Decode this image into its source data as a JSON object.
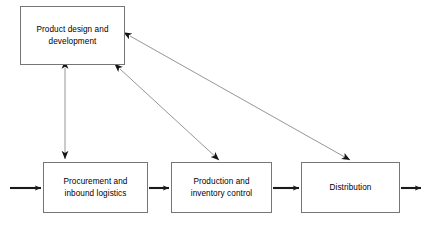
{
  "diagram": {
    "stroke_color": "#767676",
    "arrow_color": "#1a1a1a",
    "background_color": "#ffffff",
    "nodes": [
      {
        "id": "product-design",
        "label": "Product design and\ndevelopment",
        "x": 20,
        "y": 6,
        "width": 105,
        "height": 59
      },
      {
        "id": "procurement",
        "label": "Procurement and\ninbound logistics",
        "x": 43,
        "y": 162,
        "width": 105,
        "height": 51
      },
      {
        "id": "production",
        "label": "Production and\ninventory control",
        "x": 171,
        "y": 162,
        "width": 101,
        "height": 51
      },
      {
        "id": "distribution",
        "label": "Distribution",
        "x": 301,
        "y": 162,
        "width": 99,
        "height": 51
      }
    ],
    "edges": [
      {
        "id": "inbound-external-to-procurement",
        "from": "external-input",
        "to": "procurement",
        "style": "thick",
        "heads": "single",
        "x1": 10,
        "y1": 188,
        "x2": 43,
        "y2": 188
      },
      {
        "id": "procurement-to-production",
        "from": "procurement",
        "to": "production",
        "style": "thick",
        "heads": "single",
        "x1": 148,
        "y1": 188,
        "x2": 171,
        "y2": 188
      },
      {
        "id": "production-to-distribution",
        "from": "production",
        "to": "distribution",
        "style": "thick",
        "heads": "single",
        "x1": 272,
        "y1": 188,
        "x2": 301,
        "y2": 188
      },
      {
        "id": "distribution-to-external-output",
        "from": "distribution",
        "to": "external-output",
        "style": "thick",
        "heads": "single",
        "x1": 400,
        "y1": 188,
        "x2": 422,
        "y2": 188
      },
      {
        "id": "product-design-procurement",
        "from": "product-design",
        "to": "procurement",
        "style": "thin",
        "heads": "double",
        "x1": 65,
        "y1": 65,
        "x2": 65,
        "y2": 162
      },
      {
        "id": "product-design-production",
        "from": "product-design",
        "to": "production",
        "style": "thin",
        "heads": "double",
        "x1": 118,
        "y1": 66,
        "x2": 220,
        "y2": 162
      },
      {
        "id": "product-design-distribution",
        "from": "product-design",
        "to": "distribution",
        "style": "thin",
        "heads": "double",
        "x1": 127,
        "y1": 35,
        "x2": 352,
        "y2": 162
      }
    ]
  }
}
